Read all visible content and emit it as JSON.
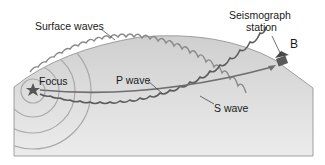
{
  "labels": {
    "surface_waves": "Surface waves",
    "seismograph_line1": "Seismograph",
    "seismograph_line2": "station",
    "station_id": "B",
    "focus": "Focus",
    "p_wave": "P wave",
    "s_wave": "S wave"
  },
  "colors": {
    "earth_fill": "#d6d6d6",
    "earth_edge": "#7a7a7a",
    "p_wave": "#6f6f6f",
    "s_wave": "#5c5c5c",
    "surface_wave": "#7d7d7d",
    "focus_star": "#555555",
    "station": "#555555"
  },
  "wavefront_rings": 4
}
